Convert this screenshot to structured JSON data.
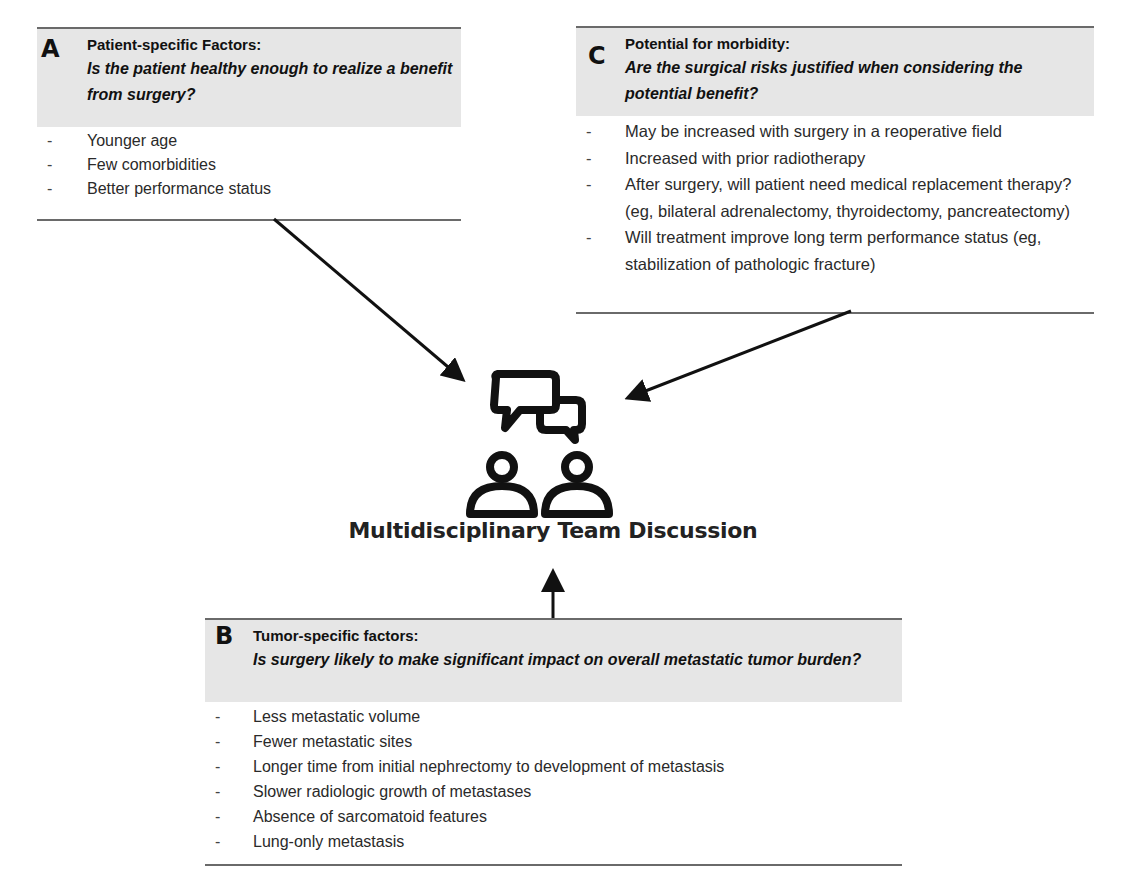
{
  "boxes": {
    "a": {
      "letter": "A",
      "title": "Patient-specific Factors:",
      "question": "Is the patient healthy enough to realize a benefit from surgery?",
      "items": [
        "Younger age",
        "Few comorbidities",
        "Better performance status"
      ]
    },
    "b": {
      "letter": "B",
      "title": "Tumor-specific factors:",
      "question": "Is surgery likely to make significant impact on overall metastatic tumor burden?",
      "items": [
        "Less metastatic volume",
        "Fewer metastatic sites",
        "Longer time from initial nephrectomy to development of metastasis",
        "Slower radiologic growth of metastases",
        "Absence of sarcomatoid features",
        "Lung-only metastasis"
      ]
    },
    "c": {
      "letter": "C",
      "title": "Potential for morbidity:",
      "question": "Are the surgical risks justified when considering the potential benefit?",
      "items": [
        "May be increased with surgery in a reoperative field",
        "Increased with prior radiotherapy",
        "After surgery, will patient need medical replacement therapy? (eg, bilateral adrenalectomy, thyroidectomy, pancreatectomy)",
        "Will treatment improve long term performance status (eg, stabilization of pathologic fracture)"
      ]
    }
  },
  "center": {
    "icon": "team-discussion-icon",
    "label": "Multidisciplinary Team Discussion"
  },
  "bullet": "-",
  "colors": {
    "header_bg": "#e6e6e6",
    "rule": "#6a6a6a",
    "ink": "#111111"
  }
}
